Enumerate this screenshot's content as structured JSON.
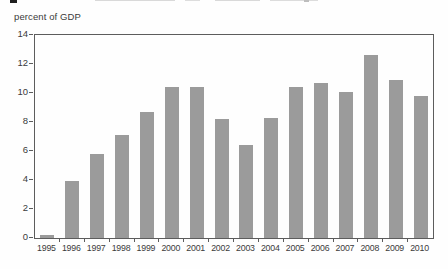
{
  "figure": {
    "axis_title": "percent of GDP"
  },
  "chart_data": {
    "type": "bar",
    "title": "",
    "ylabel": "percent of GDP",
    "xlabel": "",
    "categories": [
      "1995",
      "1996",
      "1997",
      "1998",
      "1999",
      "2000",
      "2001",
      "2002",
      "2003",
      "2004",
      "2005",
      "2006",
      "2007",
      "2008",
      "2009",
      "2010"
    ],
    "values": [
      0.2,
      3.9,
      5.8,
      7.1,
      8.7,
      10.4,
      10.4,
      8.2,
      6.4,
      8.3,
      10.4,
      10.7,
      10.1,
      12.6,
      10.9,
      9.8
    ],
    "ylim": [
      0,
      14
    ],
    "yticks": [
      0,
      2,
      4,
      6,
      8,
      10,
      12,
      14
    ],
    "grid": false,
    "legend": false,
    "bar_color": "#9b9b9b",
    "axis_color": "#5c5c5c",
    "text_color": "#3b3b3b"
  }
}
